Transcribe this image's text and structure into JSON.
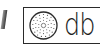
{
  "toolbar": {
    "left_fragment": {
      "icon": "partial-glyph-icon"
    },
    "sound_button": {
      "icon": "speaker-grille-icon",
      "label": "db",
      "border_color": "#2a2a2a",
      "text_color": "#1e1e1e"
    }
  }
}
